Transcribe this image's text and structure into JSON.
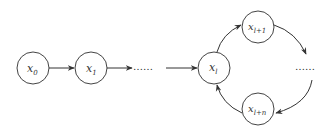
{
  "diagram": {
    "type": "state-sequence-with-cycle",
    "nodes": [
      {
        "id": "x0",
        "base": "x",
        "sub": "0"
      },
      {
        "id": "x1",
        "base": "x",
        "sub": "1"
      },
      {
        "id": "xl",
        "base": "x",
        "sub": "l"
      },
      {
        "id": "xl1",
        "base": "x",
        "sub": "l+1"
      },
      {
        "id": "xln",
        "base": "x",
        "sub": "l+n"
      }
    ],
    "ellipsis": {
      "chain": "……",
      "cycle": "……"
    },
    "edges": [
      {
        "from": "x0",
        "to": "x1"
      },
      {
        "from": "x1",
        "to": "ellipsis-chain"
      },
      {
        "from": "ellipsis-chain",
        "to": "xl"
      },
      {
        "from": "xl",
        "to": "xl1"
      },
      {
        "from": "xl1",
        "to": "ellipsis-cycle"
      },
      {
        "from": "ellipsis-cycle",
        "to": "xln"
      },
      {
        "from": "xln",
        "to": "xl"
      }
    ],
    "colors": {
      "stroke": "#333333",
      "background": "#ffffff"
    }
  }
}
